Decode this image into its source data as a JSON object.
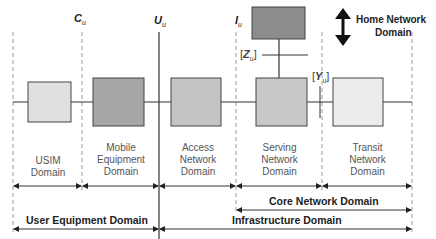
{
  "interfaces": {
    "cu": {
      "main": "C",
      "sub": "u"
    },
    "uu": {
      "main": "U",
      "sub": "u"
    },
    "iu": {
      "main": "I",
      "sub": "u"
    },
    "zu": {
      "main": "Z",
      "sub": "u",
      "prefix": "[",
      "suffix": "]"
    },
    "yu": {
      "main": "Y",
      "sub": "u",
      "prefix": "[",
      "suffix": "]"
    }
  },
  "domains": {
    "usim": {
      "line1": "USIM",
      "line2": "Domain"
    },
    "mobile_equipment": {
      "line1": "Mobile",
      "line2": "Equipment",
      "line3": "Domain"
    },
    "access_network": {
      "line1": "Access",
      "line2": "Network",
      "line3": "Domain"
    },
    "serving_network": {
      "line1": "Serving",
      "line2": "Network",
      "line3": "Domain"
    },
    "transit_network": {
      "line1": "Transit",
      "line2": "Network",
      "line3": "Domain"
    },
    "home_network": {
      "line1": "Home Network",
      "line2": "Domain"
    }
  },
  "groupings": {
    "core_network": "Core Network Domain",
    "user_equipment": "User Equipment Domain",
    "infrastructure": "Infrastructure Domain"
  },
  "colors": {
    "usim_box": "#e0e0e0",
    "mobile_equipment_box": "#a6a6a6",
    "access_network_box": "#c4c4c4",
    "serving_network_box": "#c8c8c8",
    "transit_network_box": "#ececec",
    "home_network_box": "#8c8c8c"
  }
}
